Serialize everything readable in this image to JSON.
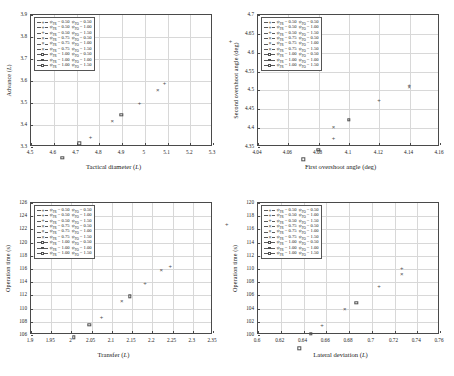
{
  "figure": {
    "panel_count": 4,
    "marker_color": "#4f4f4f",
    "grid_color": "#d8d8d8",
    "axis_color": "#4a4a4a"
  },
  "legend": {
    "entries": [
      {
        "marker": "plus",
        "label": "ψFR = 0.50  ψFO = 0.50",
        "psi_fr": 0.5,
        "psi_fo": 0.5
      },
      {
        "marker": "plus",
        "label": "ψFR = 0.50  ψFO = 1.00",
        "psi_fr": 0.5,
        "psi_fo": 1.0
      },
      {
        "marker": "plus",
        "label": "ψFR = 0.50  ψFO = 1.50",
        "psi_fr": 0.5,
        "psi_fo": 1.5
      },
      {
        "marker": "cross",
        "label": "ψFR = 0.75  ψFO = 0.50",
        "psi_fr": 0.75,
        "psi_fo": 0.5
      },
      {
        "marker": "cross",
        "label": "ψFR = 0.75  ψFO = 1.00",
        "psi_fr": 0.75,
        "psi_fo": 1.0
      },
      {
        "marker": "cross",
        "label": "ψFR = 0.75  ψFO = 1.50",
        "psi_fr": 0.75,
        "psi_fo": 1.5
      },
      {
        "marker": "square",
        "label": "ψFR = 1.00  ψFO = 0.50",
        "psi_fr": 1.0,
        "psi_fo": 0.5
      },
      {
        "marker": "square",
        "label": "ψFR = 1.00  ψFO = 1.00",
        "psi_fr": 1.0,
        "psi_fo": 1.0
      },
      {
        "marker": "square",
        "label": "ψFR = 1.00  ψFO = 1.50",
        "psi_fr": 1.0,
        "psi_fo": 1.5
      }
    ]
  },
  "chart_data": [
    {
      "id": "advance-vs-tactical-diameter",
      "type": "scatter",
      "title": "",
      "xlabel": "Tactical diameter (L)",
      "ylabel": "Advance (L)",
      "xlim": [
        4.5,
        5.3
      ],
      "ylim": [
        3.3,
        3.9
      ],
      "xticks": [
        4.5,
        4.6,
        4.7,
        4.8,
        4.9,
        5,
        5.1,
        5.2,
        5.3
      ],
      "yticks": [
        3.3,
        3.4,
        3.5,
        3.6,
        3.7,
        3.8,
        3.9
      ],
      "xtick_labels": [
        "4.5",
        "4.6",
        "4.7",
        "4.8",
        "4.9",
        "5",
        "5.1",
        "5.2",
        "5.3"
      ],
      "ytick_labels": [
        "3.3",
        "3.4",
        "3.5",
        "3.6",
        "3.7",
        "3.8",
        "3.9"
      ],
      "grid": true,
      "legend_position": "top-left",
      "points": [
        {
          "x": 5.245,
          "y": 3.845,
          "marker": "plus",
          "series": "ψFR = 0.50  ψFO = 0.50"
        },
        {
          "x": 4.955,
          "y": 3.655,
          "marker": "plus",
          "series": "ψFR = 0.50  ψFO = 1.00"
        },
        {
          "x": 4.925,
          "y": 3.625,
          "marker": "cross",
          "series": "ψFR = 0.75  ψFO = 0.50"
        },
        {
          "x": 4.845,
          "y": 3.565,
          "marker": "plus",
          "series": "ψFR = 0.50  ψFO = 1.50"
        },
        {
          "x": 4.765,
          "y": 3.51,
          "marker": "square",
          "series": "ψFR = 1.00  ψFO = 0.50"
        },
        {
          "x": 4.725,
          "y": 3.48,
          "marker": "cross",
          "series": "ψFR = 0.75  ψFO = 1.00"
        },
        {
          "x": 4.63,
          "y": 3.41,
          "marker": "plus",
          "series": "ψFR = 0.50  ψFO = 1.50"
        },
        {
          "x": 4.58,
          "y": 3.38,
          "marker": "square",
          "series": "ψFR = 1.00  ψFO = 1.00"
        },
        {
          "x": 4.505,
          "y": 3.315,
          "marker": "square",
          "series": "ψFR = 1.00  ψFO = 1.50"
        }
      ]
    },
    {
      "id": "second-vs-first-overshoot-angle",
      "type": "scatter",
      "title": "",
      "xlabel": "First overshoot angle (deg)",
      "ylabel": "Second overshoot angle (deg)",
      "xlim": [
        4.04,
        4.16
      ],
      "ylim": [
        4.35,
        4.7
      ],
      "xticks": [
        4.04,
        4.06,
        4.08,
        4.1,
        4.12,
        4.14,
        4.16
      ],
      "yticks": [
        4.35,
        4.4,
        4.45,
        4.5,
        4.55,
        4.6,
        4.65,
        4.7
      ],
      "xtick_labels": [
        "4.04",
        "4.06",
        "4.08",
        "4.1",
        "4.12",
        "4.14",
        "4.16"
      ],
      "ytick_labels": [
        "4.35",
        "4.4",
        "4.45",
        "4.5",
        "4.55",
        "4.6",
        "4.65",
        "4.7"
      ],
      "grid": true,
      "legend_position": "top-left",
      "points": [
        {
          "x": 4.16,
          "y": 4.668,
          "marker": "plus",
          "series": "ψFR = 0.50  ψFO = 0.50"
        },
        {
          "x": 4.12,
          "y": 4.551,
          "marker": "plus",
          "series": "ψFR = 0.50  ψFO = 1.00"
        },
        {
          "x": 4.12,
          "y": 4.545,
          "marker": "cross",
          "series": "ψFR = 0.75  ψFO = 0.50"
        },
        {
          "x": 4.1,
          "y": 4.512,
          "marker": "plus",
          "series": "ψFR = 0.50  ψFO = 1.50"
        },
        {
          "x": 4.08,
          "y": 4.46,
          "marker": "square",
          "series": "ψFR = 1.00  ψFO = 0.50"
        },
        {
          "x": 4.07,
          "y": 4.44,
          "marker": "cross",
          "series": "ψFR = 0.75  ψFO = 1.00"
        },
        {
          "x": 4.07,
          "y": 4.41,
          "marker": "plus",
          "series": "ψFR = 0.50  ψFO = 1.50"
        },
        {
          "x": 4.06,
          "y": 4.38,
          "marker": "square",
          "series": "ψFR = 1.00  ψFO = 1.00"
        },
        {
          "x": 4.05,
          "y": 4.355,
          "marker": "square",
          "series": "ψFR = 1.00  ψFO = 1.50"
        }
      ]
    },
    {
      "id": "operation-time-vs-transfer",
      "type": "scatter",
      "title": "",
      "xlabel": "Transfer (L)",
      "ylabel": "Operation time (s)",
      "xlim": [
        1.9,
        2.35
      ],
      "ylim": [
        106,
        126
      ],
      "xticks": [
        1.9,
        1.95,
        2,
        2.05,
        2.1,
        2.15,
        2.2,
        2.25,
        2.3,
        2.35
      ],
      "yticks": [
        106,
        108,
        110,
        112,
        114,
        116,
        118,
        120,
        122,
        124,
        126
      ],
      "xtick_labels": [
        "1.9",
        "1.95",
        "2",
        "2.05",
        "2.1",
        "2.15",
        "2.2",
        "2.25",
        "2.3",
        "2.35"
      ],
      "ytick_labels": [
        "106",
        "108",
        "110",
        "112",
        "114",
        "116",
        "118",
        "120",
        "122",
        "124",
        "126"
      ],
      "grid": true,
      "legend_position": "top-left",
      "points": [
        {
          "x": 2.31,
          "y": 125.0,
          "marker": "plus",
          "series": "ψFR = 0.50  ψFO = 0.50"
        },
        {
          "x": 2.17,
          "y": 118.6,
          "marker": "plus",
          "series": "ψFR = 0.50  ψFO = 1.00"
        },
        {
          "x": 2.148,
          "y": 117.9,
          "marker": "cross",
          "series": "ψFR = 0.75  ψFO = 0.50"
        },
        {
          "x": 2.108,
          "y": 116.0,
          "marker": "plus",
          "series": "ψFR = 0.50  ψFO = 1.50"
        },
        {
          "x": 2.07,
          "y": 114.0,
          "marker": "square",
          "series": "ψFR = 1.00  ψFO = 0.50"
        },
        {
          "x": 2.05,
          "y": 113.2,
          "marker": "cross",
          "series": "ψFR = 0.75  ψFO = 1.00"
        },
        {
          "x": 2.0,
          "y": 110.9,
          "marker": "plus",
          "series": "ψFR = 0.50  ψFO = 1.50"
        },
        {
          "x": 1.97,
          "y": 109.7,
          "marker": "square",
          "series": "ψFR = 1.00  ψFO = 1.00"
        },
        {
          "x": 1.932,
          "y": 107.8,
          "marker": "square",
          "series": "ψFR = 1.00  ψFO = 1.50"
        }
      ]
    },
    {
      "id": "operation-time-vs-lateral-deviation",
      "type": "scatter",
      "title": "",
      "xlabel": "Lateral deviation (L)",
      "ylabel": "Operation time (s)",
      "xlim": [
        0.6,
        0.76
      ],
      "ylim": [
        100,
        120
      ],
      "xticks": [
        0.6,
        0.62,
        0.64,
        0.66,
        0.68,
        0.7,
        0.72,
        0.74,
        0.76
      ],
      "yticks": [
        100,
        102,
        104,
        106,
        108,
        110,
        112,
        114,
        116,
        118,
        120
      ],
      "xtick_labels": [
        "0.6",
        "0.62",
        "0.64",
        "0.66",
        "0.68",
        "0.7",
        "0.72",
        "0.74",
        "0.76"
      ],
      "ytick_labels": [
        "100",
        "102",
        "104",
        "106",
        "108",
        "110",
        "112",
        "114",
        "116",
        "118",
        "120"
      ],
      "grid": true,
      "legend_position": "top-left",
      "points": [
        {
          "x": 0.76,
          "y": 119.3,
          "marker": "plus",
          "series": "ψFR = 0.50  ψFO = 0.50"
        },
        {
          "x": 0.7,
          "y": 112.2,
          "marker": "plus",
          "series": "ψFR = 0.50  ψFO = 1.00"
        },
        {
          "x": 0.7,
          "y": 111.4,
          "marker": "cross",
          "series": "ψFR = 0.75  ψFO = 0.50"
        },
        {
          "x": 0.68,
          "y": 109.5,
          "marker": "plus",
          "series": "ψFR = 0.50  ψFO = 1.50"
        },
        {
          "x": 0.66,
          "y": 107.0,
          "marker": "square",
          "series": "ψFR = 1.00  ψFO = 0.50"
        },
        {
          "x": 0.65,
          "y": 106.0,
          "marker": "cross",
          "series": "ψFR = 0.75  ψFO = 1.00"
        },
        {
          "x": 0.63,
          "y": 103.6,
          "marker": "plus",
          "series": "ψFR = 0.50  ψFO = 1.50"
        },
        {
          "x": 0.62,
          "y": 102.3,
          "marker": "square",
          "series": "ψFR = 1.00  ψFO = 1.00"
        },
        {
          "x": 0.61,
          "y": 100.1,
          "marker": "square",
          "series": "ψFR = 1.00  ψFO = 1.50"
        }
      ]
    }
  ]
}
